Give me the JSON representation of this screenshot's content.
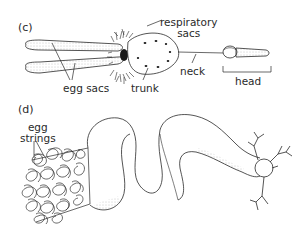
{
  "panels": [
    {
      "id": "c",
      "label": "(c)",
      "annotations": {
        "respiratory_sacs": [
          "respiratory",
          "sacs"
        ],
        "egg_sacs": "egg sacs",
        "trunk": "trunk",
        "neck": "neck",
        "head": "head"
      }
    },
    {
      "id": "d",
      "label": "(d)",
      "annotations": {
        "egg_strings": [
          "egg",
          "strings"
        ]
      }
    }
  ],
  "colors": {
    "ink": "#2a2a2a",
    "background": "#ffffff",
    "stipple": "#9a9a9a"
  }
}
